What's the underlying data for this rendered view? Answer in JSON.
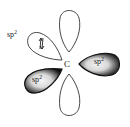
{
  "diagram": {
    "center_atom": "C",
    "orbitals": [
      {
        "id": "p-top",
        "type": "p",
        "filled": false,
        "label": ""
      },
      {
        "id": "p-bottom",
        "type": "p",
        "filled": false,
        "label": ""
      },
      {
        "id": "sp2-upper-left",
        "type": "sp2",
        "label_base": "sp",
        "label_sup": "2",
        "electrons": "↿⇂",
        "shaded": false
      },
      {
        "id": "sp2-right",
        "type": "sp2",
        "label_base": "sp",
        "label_sup": "2",
        "shaded": true
      },
      {
        "id": "sp2-lower-left",
        "type": "sp2",
        "label_base": "sp",
        "label_sup": "2",
        "shaded": true
      }
    ],
    "colors": {
      "outline": "#333333",
      "shade_dark": "#111111",
      "shade_light": "#e8e8e8",
      "background": "#ffffff"
    }
  }
}
